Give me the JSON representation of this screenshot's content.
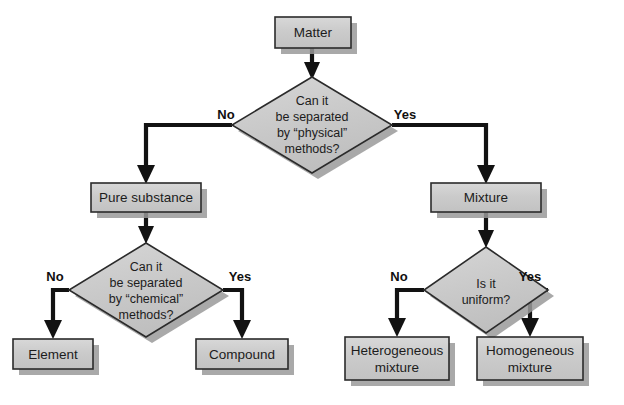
{
  "diagram": {
    "type": "flowchart",
    "canvas": {
      "width": 624,
      "height": 405
    },
    "colors": {
      "shape_fill": "#c9c9c9",
      "shape_fill_light": "#d4d4d4",
      "shape_border": "#2b2b2b",
      "shadow": "#9a9a9a",
      "connector": "#121212",
      "text": "#1c1c1c",
      "background": "#ffffff"
    },
    "nodes": [
      {
        "id": "matter",
        "shape": "rect",
        "label": "Matter",
        "lines": [
          "Matter"
        ],
        "x": 275,
        "y": 17,
        "w": 76,
        "h": 31
      },
      {
        "id": "q-physical",
        "shape": "diamond",
        "label": "Can it be separated by “physical” methods?",
        "lines": [
          "Can it",
          "be separated",
          "by “physical”",
          "methods?"
        ],
        "cx": 312,
        "cy": 125,
        "rx": 80,
        "ry": 48
      },
      {
        "id": "pure-substance",
        "shape": "rect",
        "label": "Pure substance",
        "lines": [
          "Pure substance"
        ],
        "x": 91,
        "y": 183,
        "w": 110,
        "h": 29
      },
      {
        "id": "mixture",
        "shape": "rect",
        "label": "Mixture",
        "lines": [
          "Mixture"
        ],
        "x": 431,
        "y": 183,
        "w": 110,
        "h": 29
      },
      {
        "id": "q-chemical",
        "shape": "diamond",
        "label": "Can it be separated by “chemical” methods?",
        "lines": [
          "Can it",
          "be separated",
          "by “chemical”",
          "methods?"
        ],
        "cx": 146,
        "cy": 290,
        "rx": 77,
        "ry": 47
      },
      {
        "id": "q-uniform",
        "shape": "diamond",
        "label": "Is it uniform?",
        "lines": [
          "Is it",
          "uniform?"
        ],
        "cx": 486,
        "cy": 290,
        "rx": 62,
        "ry": 43
      },
      {
        "id": "element",
        "shape": "rect",
        "label": "Element",
        "lines": [
          "Element"
        ],
        "x": 13,
        "y": 339,
        "w": 80,
        "h": 30
      },
      {
        "id": "compound",
        "shape": "rect",
        "label": "Compound",
        "lines": [
          "Compound"
        ],
        "x": 196,
        "y": 339,
        "w": 92,
        "h": 30
      },
      {
        "id": "heterogeneous-mixture",
        "shape": "rect",
        "label": "Heterogeneous mixture",
        "lines": [
          "Heterogeneous",
          "mixture"
        ],
        "x": 345,
        "y": 337,
        "w": 104,
        "h": 43
      },
      {
        "id": "homogeneous-mixture",
        "shape": "rect",
        "label": "Homogeneous mixture",
        "lines": [
          "Homogeneous",
          "mixture"
        ],
        "x": 477,
        "y": 337,
        "w": 106,
        "h": 43
      }
    ],
    "edges": [
      {
        "id": "matter-to-q-physical",
        "from": "matter",
        "to": "q-physical",
        "label": ""
      },
      {
        "id": "q-physical-no",
        "from": "q-physical",
        "to": "pure-substance",
        "label": "No"
      },
      {
        "id": "q-physical-yes",
        "from": "q-physical",
        "to": "mixture",
        "label": "Yes"
      },
      {
        "id": "pure-substance-to-q-chemical",
        "from": "pure-substance",
        "to": "q-chemical",
        "label": ""
      },
      {
        "id": "mixture-to-q-uniform",
        "from": "mixture",
        "to": "q-uniform",
        "label": ""
      },
      {
        "id": "q-chemical-no",
        "from": "q-chemical",
        "to": "element",
        "label": "No"
      },
      {
        "id": "q-chemical-yes",
        "from": "q-chemical",
        "to": "compound",
        "label": "Yes"
      },
      {
        "id": "q-uniform-no",
        "from": "q-uniform",
        "to": "heterogeneous-mixture",
        "label": "No"
      },
      {
        "id": "q-uniform-yes",
        "from": "q-uniform",
        "to": "homogeneous-mixture",
        "label": "Yes"
      }
    ],
    "branch_labels": {
      "physical_no": "No",
      "physical_yes": "Yes",
      "chemical_no": "No",
      "chemical_yes": "Yes",
      "uniform_no": "No",
      "uniform_yes": "Yes"
    }
  }
}
